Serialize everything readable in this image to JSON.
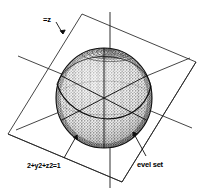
{
  "figure": {
    "background_color": "#ffffff",
    "ink_color": "#1a1a1a",
    "sphere_fill": "#d8d8d8",
    "width": 200,
    "height": 196
  },
  "labels": {
    "function_label": "=z",
    "sphere_equation_prefix": "2",
    "sphere_equation_rest": "+y2+z2=1",
    "sphere_equation_full": "2+y2+z2=1",
    "level_set_label": "evel set"
  },
  "annotations": [
    {
      "name": "function-label",
      "text": "=z",
      "arrow_to": "plane-edge"
    },
    {
      "name": "sphere-equation-label",
      "text": "2+y2+z2=1",
      "arrow_to": "sphere-surface-lower-left"
    },
    {
      "name": "level-set-label",
      "text": "evel set",
      "arrow_to": "sphere-surface-lower-right"
    }
  ],
  "geometry": {
    "sphere": {
      "center_x": 104,
      "center_y": 98,
      "radius_x": 48,
      "radius_y": 50
    },
    "z_axis": {
      "x": 110,
      "y_top": 12,
      "y_bottom": 188
    },
    "plane_corners": [
      [
        82,
        14
      ],
      [
        196,
        62
      ],
      [
        122,
        182
      ],
      [
        8,
        134
      ]
    ],
    "spokes": 6,
    "pole_rings": 7
  }
}
